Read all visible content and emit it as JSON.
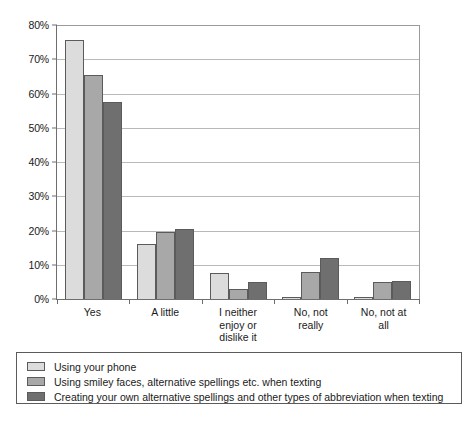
{
  "chart_data": {
    "type": "bar",
    "title": "",
    "subtitle": "",
    "xlabel": "",
    "ylabel": "",
    "ylim": [
      0,
      80
    ],
    "ytick_step": 10,
    "ytick_labels": [
      "0%",
      "10%",
      "20%",
      "30%",
      "40%",
      "50%",
      "60%",
      "70%",
      "80%"
    ],
    "grid": true,
    "legend_position": "bottom",
    "categories": [
      "Yes",
      "A little",
      "I neither enjoy or dislike it",
      "No, not really",
      "No, not at all"
    ],
    "category_label_lines": [
      [
        "Yes"
      ],
      [
        "A little"
      ],
      [
        "I neither",
        "enjoy or",
        "dislike it"
      ],
      [
        "No, not",
        "really"
      ],
      [
        "No, not at",
        "all"
      ]
    ],
    "series": [
      {
        "name": "Using your phone",
        "color": "#dcdcdc",
        "values": [
          75.5,
          16,
          7.5,
          0.6,
          0.6
        ]
      },
      {
        "name": "Using smiley faces, alternative spellings etc. when texting",
        "color": "#a8a8a8",
        "values": [
          65.5,
          19.5,
          3,
          8,
          5
        ]
      },
      {
        "name": "Creating your own alternative spellings and other types of abbreviation when texting",
        "color": "#6f6f6f",
        "values": [
          57.5,
          20.5,
          5,
          12,
          5.3
        ]
      }
    ]
  },
  "colors": {
    "series_light": "#dcdcdc",
    "series_medium": "#a8a8a8",
    "series_dark": "#6f6f6f",
    "axis": "#6e6e6e",
    "gridline": "#b9b9b9",
    "background": "#ffffff"
  }
}
